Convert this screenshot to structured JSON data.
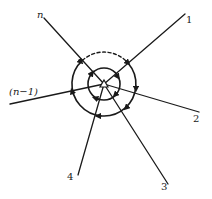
{
  "diagram": {
    "type": "radial-branch-loops",
    "center": {
      "x": 104,
      "y": 84
    },
    "branches": [
      {
        "id": "n",
        "label": "n",
        "end": {
          "x": 44,
          "y": 18
        },
        "label_pos": {
          "x": 37,
          "y": 10
        }
      },
      {
        "id": "1",
        "label": "1",
        "end": {
          "x": 185,
          "y": 14
        },
        "label_pos": {
          "x": 186,
          "y": 15
        }
      },
      {
        "id": "2",
        "label": "2",
        "end": {
          "x": 199,
          "y": 112
        },
        "label_pos": {
          "x": 193,
          "y": 114
        }
      },
      {
        "id": "3",
        "label": "3",
        "end": {
          "x": 168,
          "y": 184
        },
        "label_pos": {
          "x": 161,
          "y": 182
        }
      },
      {
        "id": "4",
        "label": "4",
        "end": {
          "x": 78,
          "y": 175
        },
        "label_pos": {
          "x": 67,
          "y": 172
        }
      },
      {
        "id": "n-1",
        "label": "(n−1)",
        "end": {
          "x": 10,
          "y": 104
        },
        "label_pos": {
          "x": 9,
          "y": 87
        }
      }
    ],
    "loops": [
      {
        "name": "inner-loop",
        "radius": 16,
        "dashed_segment": false
      },
      {
        "name": "outer-loop",
        "radius": 32,
        "dashed_segment": "top arc between branch n and branch 1"
      }
    ],
    "line_color": "#1a1a1a"
  }
}
